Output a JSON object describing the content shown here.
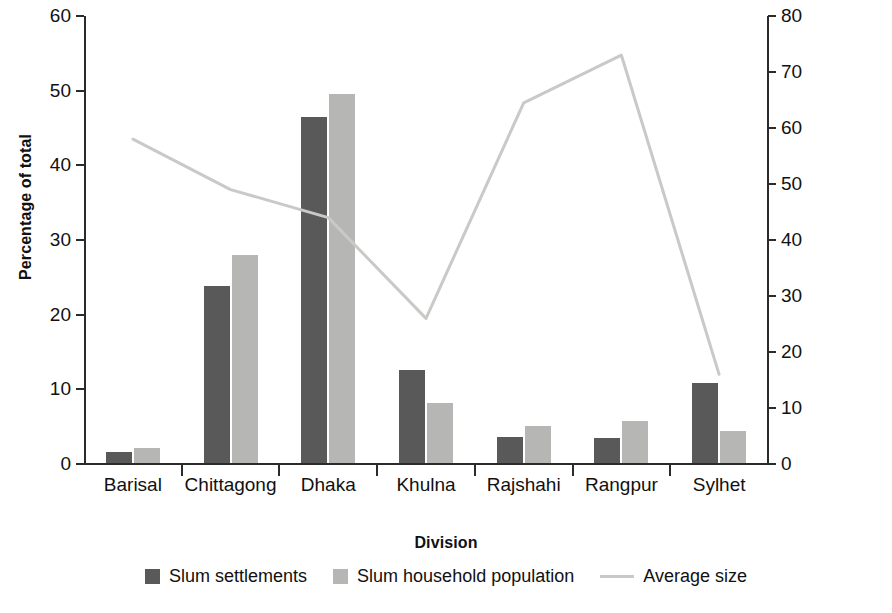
{
  "chart_data": {
    "type": "bar",
    "title": "",
    "xlabel": "Division",
    "ylabel": "Percentage of total",
    "y2label": "Average households per settlement",
    "categories": [
      "Barisal",
      "Chittagong",
      "Dhaka",
      "Khulna",
      "Rajshahi",
      "Rangpur",
      "Sylhet"
    ],
    "ylim": [
      0,
      60
    ],
    "yticks": [
      0,
      10,
      20,
      30,
      40,
      50,
      60
    ],
    "y2lim": [
      0,
      80
    ],
    "y2ticks": [
      0,
      10,
      20,
      30,
      40,
      50,
      60,
      70,
      80
    ],
    "grid": false,
    "legend_position": "bottom",
    "series": [
      {
        "name": "Slum settlements",
        "kind": "bar",
        "axis": "left",
        "color": "#59595a",
        "values": [
          1.5,
          23.7,
          46.4,
          12.4,
          3.5,
          3.4,
          10.7
        ]
      },
      {
        "name": "Slum household population",
        "kind": "bar",
        "axis": "left",
        "color": "#b6b6b4",
        "values": [
          2.0,
          27.8,
          49.4,
          8.0,
          4.9,
          5.6,
          4.3
        ]
      },
      {
        "name": "Average size",
        "kind": "line",
        "axis": "right",
        "color": "#c9c9c7",
        "values": [
          58,
          49,
          44,
          26,
          64.5,
          73,
          16
        ]
      }
    ]
  },
  "legend": {
    "items": [
      {
        "label": "Slum settlements",
        "swatch": "dark-square-swatch"
      },
      {
        "label": "Slum household population",
        "swatch": "light-square-swatch"
      },
      {
        "label": "Average size",
        "swatch": "line-swatch"
      }
    ]
  }
}
